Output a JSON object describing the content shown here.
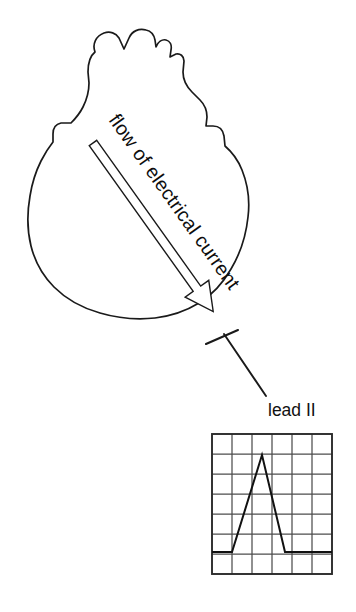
{
  "figure": {
    "background_color": "#ffffff",
    "ink_color": "#1a1a1a"
  },
  "heart": {
    "name": "heart-outline",
    "description": "hand-drawn anterior heart silhouette with great vessels at top"
  },
  "current_arrow": {
    "label": "flow of electrical current",
    "direction": "from base upper-left to apex lower-right",
    "style": "hollow outlined arrow",
    "rotation_degrees": 41,
    "tail": {
      "x": 93,
      "y": 143
    },
    "tip": {
      "x": 213,
      "y": 312
    }
  },
  "electrode": {
    "marker_name": "lead-electrode-marker",
    "leader_line_from": {
      "x": 226,
      "y": 338
    },
    "leader_line_to": {
      "x": 266,
      "y": 396
    }
  },
  "lead_label": {
    "text": "lead II",
    "x": 268,
    "y": 416
  },
  "chart_data": {
    "type": "line",
    "title": "lead II",
    "xlabel": "",
    "ylabel": "",
    "grid": true,
    "legend_position": "none",
    "grid_columns": 6,
    "grid_rows": 7,
    "cell_size_px": 20,
    "plot_box": {
      "x": 212,
      "y": 434,
      "width": 120,
      "height": 140
    },
    "baseline_row_from_top": 6,
    "baseline_y": 552,
    "waveform_name": "qrs-complex",
    "x": [
      212,
      232,
      262,
      285,
      332
    ],
    "y": [
      552,
      552,
      455,
      552,
      552
    ],
    "annotations": [
      "flat isoelectric baseline before QRS",
      "tall narrow upright QRS complex peaking near top of grid",
      "return to flat baseline after QRS"
    ],
    "peak_height_cells": 4.85,
    "qrs_width_cells": 2.65,
    "xlim": [
      212,
      332
    ],
    "ylim": [
      434,
      574
    ]
  }
}
